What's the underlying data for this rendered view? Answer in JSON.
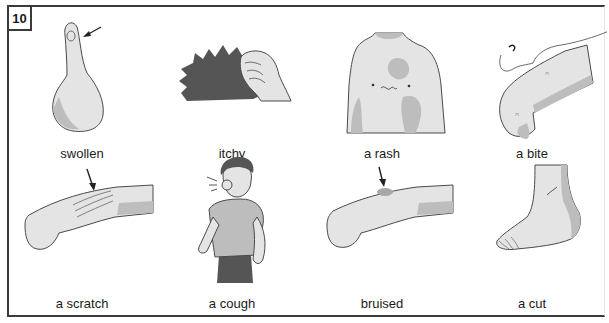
{
  "exercise": {
    "number": "10"
  },
  "items": [
    {
      "label": "swollen",
      "icon": "swollen-thumb"
    },
    {
      "label": "itchy",
      "icon": "itchy-scratching-hand"
    },
    {
      "label": "a rash",
      "icon": "rash-chest"
    },
    {
      "label": "a bite",
      "icon": "bite-knee-insect"
    },
    {
      "label": "a scratch",
      "icon": "scratch-arm"
    },
    {
      "label": "a cough",
      "icon": "coughing-man"
    },
    {
      "label": "bruised",
      "icon": "bruised-arm"
    },
    {
      "label": "a cut",
      "icon": "cut-foot"
    }
  ],
  "colors": {
    "border": "#3a3a3a",
    "skin_light": "#e4e4e4",
    "skin_shade": "#bdbdbd",
    "dark_fill": "#555555",
    "outline": "#4a4a4a"
  }
}
